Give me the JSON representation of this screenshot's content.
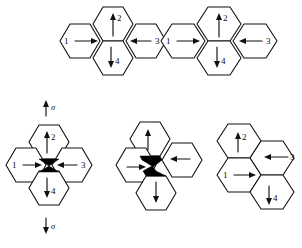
{
  "figure": {
    "kind": "hexagonal-cell-diagram",
    "background_color": "#ffffff",
    "line_color": "#111111",
    "fill_color": "#000000",
    "width": 302,
    "height": 248,
    "stress_labels": {
      "top": "σ",
      "bottom": "σ"
    },
    "clusters": [
      {
        "id": "top-left",
        "name": "undeformed-cluster-top-left",
        "arrangement": "four-hexagons-about-vertex",
        "has_void": false,
        "cells": [
          {
            "id": "1",
            "label": "1",
            "arrow_direction": "right",
            "position": "left"
          },
          {
            "id": "2",
            "label": "2",
            "arrow_direction": "up",
            "position": "top"
          },
          {
            "id": "3",
            "label": "3",
            "arrow_direction": "left",
            "position": "right"
          },
          {
            "id": "4",
            "label": "4",
            "arrow_direction": "down",
            "position": "bottom"
          }
        ]
      },
      {
        "id": "top-right",
        "name": "undeformed-cluster-top-right",
        "arrangement": "four-hexagons-about-vertex",
        "has_void": false,
        "cells": [
          {
            "id": "1",
            "label": "1",
            "arrow_direction": "right",
            "position": "left"
          },
          {
            "id": "2",
            "label": "2",
            "arrow_direction": "up",
            "position": "top"
          },
          {
            "id": "3",
            "label": "3",
            "arrow_direction": "left",
            "position": "right"
          },
          {
            "id": "4",
            "label": "4",
            "arrow_direction": "down",
            "position": "bottom"
          }
        ]
      },
      {
        "id": "bottom-left",
        "name": "void-cluster-bottom-left",
        "arrangement": "four-hexagons-about-void",
        "has_void": true,
        "void_shape": "bowtie-upright",
        "cells": [
          {
            "id": "1",
            "label": "1",
            "arrow_direction": "right",
            "position": "left"
          },
          {
            "id": "2",
            "label": "2",
            "arrow_direction": "up",
            "position": "top"
          },
          {
            "id": "3",
            "label": "3",
            "arrow_direction": "left",
            "position": "right"
          },
          {
            "id": "4",
            "label": "4",
            "arrow_direction": "down",
            "position": "bottom"
          }
        ]
      },
      {
        "id": "bottom-middle",
        "name": "void-cluster-bottom-middle",
        "arrangement": "four-hexagons-about-sheared-void",
        "has_void": true,
        "void_shape": "bowtie-sheared",
        "cells": [
          {
            "id": "1",
            "label": "",
            "arrow_direction": "right",
            "position": "left"
          },
          {
            "id": "2",
            "label": "",
            "arrow_direction": "up",
            "position": "top"
          },
          {
            "id": "3",
            "label": "",
            "arrow_direction": "left",
            "position": "right"
          },
          {
            "id": "4",
            "label": "",
            "arrow_direction": "down",
            "position": "bottom"
          }
        ]
      },
      {
        "id": "bottom-right",
        "name": "collapsed-cluster-bottom-right",
        "arrangement": "four-hexagons-staggered-rhombus",
        "has_void": false,
        "cells": [
          {
            "id": "1",
            "label": "1",
            "arrow_direction": "right",
            "position": "lower-left"
          },
          {
            "id": "2",
            "label": "2",
            "arrow_direction": "up",
            "position": "upper-left"
          },
          {
            "id": "3",
            "label": "3",
            "arrow_direction": "left",
            "position": "upper-right"
          },
          {
            "id": "4",
            "label": "4",
            "arrow_direction": "down",
            "position": "lower-right"
          }
        ]
      }
    ]
  }
}
